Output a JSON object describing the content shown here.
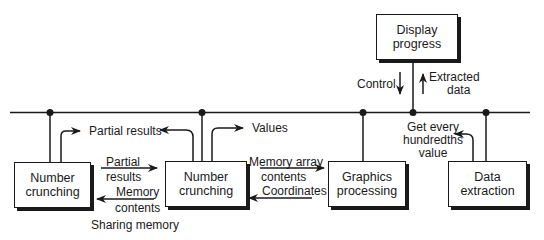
{
  "diagram": {
    "nodes": {
      "display": {
        "line1": "Display",
        "line2": "progress"
      },
      "nc1": {
        "line1": "Number",
        "line2": "crunching"
      },
      "nc2": {
        "line1": "Number",
        "line2": "crunching"
      },
      "graphics": {
        "line1": "Graphics",
        "line2": "processing"
      },
      "extraction": {
        "line1": "Data",
        "line2": "extraction"
      }
    },
    "labels": {
      "control": "Control",
      "extracted_1": "Extracted",
      "extracted_2": "data",
      "partial_results_top": "Partial results",
      "values": "Values",
      "get_every_1": "Get every",
      "get_every_2": "hundredths",
      "get_every_3": "value",
      "partial_1": "Partial",
      "partial_2": "results",
      "memory_1": "Memory",
      "memory_2": "contents",
      "mem_array_1": "Memory array",
      "mem_array_2": "contents",
      "coordinates": "Coordinates",
      "sharing_memory": "Sharing memory"
    }
  }
}
